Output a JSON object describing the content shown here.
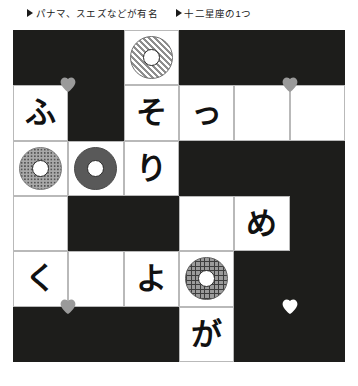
{
  "clues": [
    {
      "marker": "triangle-right",
      "text": "パナマ、スエズなどが有名"
    },
    {
      "marker": "triangle-right",
      "text": "十二星座の1つ"
    }
  ],
  "colors": {
    "block": "#1d1d1b",
    "cell": "#ffffff",
    "grid_line": "#b9b9b9",
    "text": "#111111",
    "heart_gray": "#9a9a9a",
    "heart_white": "#ffffff"
  },
  "grid": {
    "rows": 6,
    "cols": 6,
    "cells": [
      [
        {
          "type": "block",
          "text": ""
        },
        {
          "type": "block",
          "text": ""
        },
        {
          "type": "ring",
          "pattern": "diagonal",
          "text": ""
        },
        {
          "type": "block",
          "text": ""
        },
        {
          "type": "block",
          "text": ""
        },
        {
          "type": "block",
          "text": ""
        }
      ],
      [
        {
          "type": "letter",
          "text": "ふ"
        },
        {
          "type": "block",
          "text": ""
        },
        {
          "type": "letter",
          "text": "そ"
        },
        {
          "type": "letter",
          "text": "っ"
        },
        {
          "type": "empty",
          "text": ""
        },
        {
          "type": "empty",
          "text": ""
        }
      ],
      [
        {
          "type": "ring",
          "pattern": "dotted",
          "text": ""
        },
        {
          "type": "ring",
          "pattern": "solid",
          "text": ""
        },
        {
          "type": "letter",
          "text": "り"
        },
        {
          "type": "block",
          "text": ""
        },
        {
          "type": "block",
          "text": ""
        },
        {
          "type": "block",
          "text": ""
        }
      ],
      [
        {
          "type": "empty",
          "text": ""
        },
        {
          "type": "block",
          "text": ""
        },
        {
          "type": "block",
          "text": ""
        },
        {
          "type": "empty",
          "text": ""
        },
        {
          "type": "letter",
          "text": "め"
        },
        {
          "type": "block",
          "text": ""
        }
      ],
      [
        {
          "type": "letter",
          "text": "く"
        },
        {
          "type": "empty",
          "text": ""
        },
        {
          "type": "letter",
          "text": "よ"
        },
        {
          "type": "ring",
          "pattern": "cross",
          "text": ""
        },
        {
          "type": "block",
          "text": ""
        },
        {
          "type": "block",
          "text": ""
        }
      ],
      [
        {
          "type": "block",
          "text": ""
        },
        {
          "type": "block",
          "text": ""
        },
        {
          "type": "block",
          "text": ""
        },
        {
          "type": "letter",
          "text": "が"
        },
        {
          "type": "block",
          "text": ""
        },
        {
          "type": "block",
          "text": ""
        }
      ]
    ]
  },
  "markers": [
    {
      "name": "heart-marker-1",
      "color": "#9a9a9a",
      "col": 1,
      "row": 1
    },
    {
      "name": "heart-marker-2",
      "color": "#9a9a9a",
      "col": 5,
      "row": 1
    },
    {
      "name": "heart-marker-3",
      "color": "#9a9a9a",
      "col": 1,
      "row": 5
    },
    {
      "name": "heart-marker-4",
      "color": "#ffffff",
      "col": 5,
      "row": 5
    }
  ]
}
